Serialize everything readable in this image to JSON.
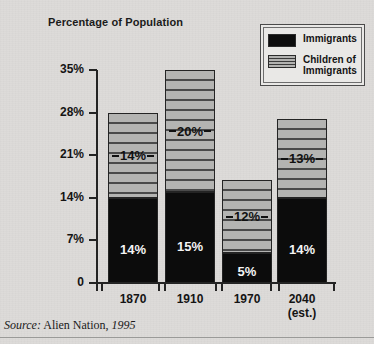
{
  "axis_title": "Percentage of\nPopulation",
  "legend": {
    "title": "",
    "items": [
      {
        "label": "Immigrants",
        "swatch": "solid-black-swatch",
        "color": "#0c0c0c"
      },
      {
        "label": "Children of\nImmigrants",
        "swatch": "horizontal-striped-swatch",
        "color": "#b4b4b2"
      }
    ]
  },
  "source": {
    "prefix": "Source:",
    "work": " Alien Nation, ",
    "year": "1995"
  },
  "chart_data": {
    "type": "bar",
    "subtype": "stacked-bar",
    "title": "",
    "subtitle": "",
    "xlabel": "",
    "ylabel": "Percentage of Population",
    "categories": [
      "1870",
      "1910",
      "1970",
      "2040\n(est.)"
    ],
    "category_labels": [
      {
        "line1": "1870",
        "line2": ""
      },
      {
        "line1": "1910",
        "line2": ""
      },
      {
        "line1": "1970",
        "line2": ""
      },
      {
        "line1": "2040",
        "line2": "(est.)"
      }
    ],
    "series": [
      {
        "name": "Immigrants",
        "values": [
          14,
          15,
          5,
          14
        ],
        "value_labels": [
          "14%",
          "15%",
          "5%",
          "14%"
        ],
        "color": "#0c0c0c"
      },
      {
        "name": "Children of Immigrants",
        "values": [
          14,
          20,
          12,
          13
        ],
        "value_labels": [
          "14%",
          "20%",
          "12%",
          "13%"
        ],
        "color": "#b4b4b2"
      }
    ],
    "totals": [
      28,
      35,
      17,
      27
    ],
    "ylim": [
      0,
      35
    ],
    "yticks": [
      0,
      7,
      14,
      21,
      28,
      35
    ],
    "ytick_labels": [
      "0",
      "7%",
      "14%",
      "21%",
      "28%",
      "35%"
    ],
    "grid": false,
    "legend_position": "top-right"
  }
}
